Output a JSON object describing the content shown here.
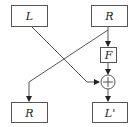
{
  "diagram": {
    "type": "feistel-round",
    "colors": {
      "stroke": "#555555",
      "text": "#222222",
      "background": "#ffffff"
    },
    "nodes": {
      "L_in": {
        "label": "L"
      },
      "R_in": {
        "label": "R"
      },
      "F": {
        "label": "F"
      },
      "xor": {
        "label": "+"
      },
      "R_out": {
        "label": "R"
      },
      "L_out": {
        "label": "L'"
      }
    },
    "edges": [
      {
        "from": "L_in",
        "to": "xor"
      },
      {
        "from": "R_in",
        "to": "F"
      },
      {
        "from": "F",
        "to": "xor"
      },
      {
        "from": "R_in",
        "to": "R_out"
      },
      {
        "from": "xor",
        "to": "L_out"
      }
    ]
  }
}
